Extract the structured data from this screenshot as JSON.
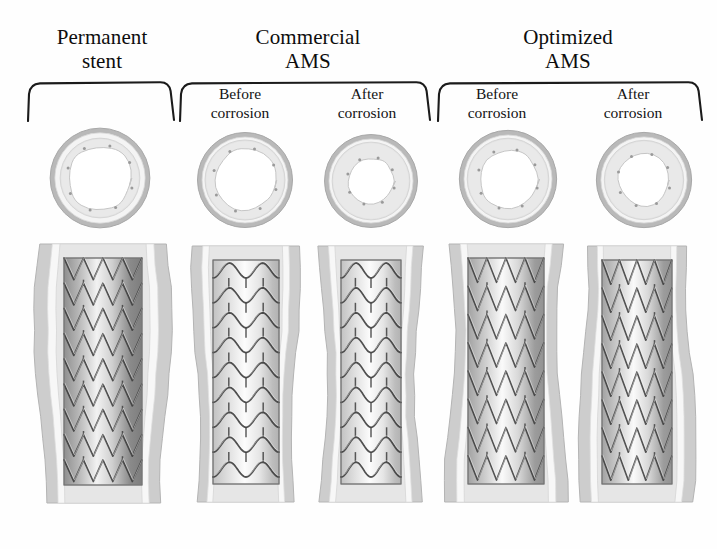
{
  "figure": {
    "title_permanent": "Permanent\nstent",
    "title_commercial": "Commercial\nAMS",
    "title_optimized": "Optimized\nAMS",
    "label_before": "Before\ncorrosion",
    "label_after": "After\ncorrosion",
    "background_color": "#fefefe",
    "ink_color": "#111111"
  },
  "groups": [
    {
      "id": "permanent-stent",
      "title": "Permanent\nstent",
      "columns": [
        {
          "id": "permanent",
          "sub_label": "",
          "lumen_radius": 46,
          "stent_radius": 56,
          "vessel_radius": 70,
          "strut_pattern": "zigzag-v",
          "rings": 9,
          "stent_width": 78,
          "vessel_width": 126,
          "shade": "dark"
        }
      ]
    },
    {
      "id": "commercial-ams",
      "title": "Commercial\nAMS",
      "columns": [
        {
          "id": "commercial-before",
          "sub_label": "Before\ncorrosion",
          "lumen_radius": 38,
          "stent_radius": 48,
          "vessel_radius": 57,
          "strut_pattern": "sinusoid-bridge",
          "rings": 9,
          "stent_width": 66,
          "vessel_width": 100,
          "shade": "light"
        },
        {
          "id": "commercial-after",
          "sub_label": "After\ncorrosion",
          "lumen_radius": 28,
          "stent_radius": 46,
          "vessel_radius": 55,
          "strut_pattern": "sinusoid-bridge",
          "rings": 9,
          "stent_width": 60,
          "vessel_width": 96,
          "shade": "light"
        }
      ]
    },
    {
      "id": "optimized-ams",
      "title": "Optimized\nAMS",
      "columns": [
        {
          "id": "optimized-before",
          "sub_label": "Before\ncorrosion",
          "lumen_radius": 38,
          "stent_radius": 52,
          "vessel_radius": 62,
          "strut_pattern": "zigzag-v",
          "rings": 8,
          "stent_width": 76,
          "vessel_width": 112,
          "shade": "mid"
        },
        {
          "id": "optimized-after",
          "sub_label": "After\ncorrosion",
          "lumen_radius": 33,
          "stent_radius": 50,
          "vessel_radius": 60,
          "strut_pattern": "zigzag-v",
          "rings": 8,
          "stent_width": 70,
          "vessel_width": 108,
          "shade": "mid"
        }
      ]
    }
  ],
  "rows": {
    "cross_section_row_label": "cross-sectional views",
    "longitudinal_row_label": "longitudinal views"
  }
}
